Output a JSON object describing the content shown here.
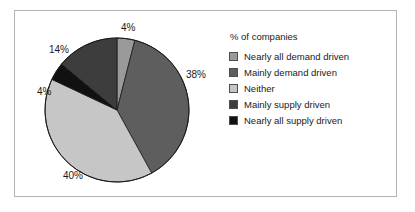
{
  "chart_data": {
    "type": "pie",
    "title": "",
    "legend_title": "% of companies",
    "legend_position": "right",
    "grid": false,
    "units": "percent",
    "categories": [
      "Nearly all demand driven",
      "Mainly demand driven",
      "Neither",
      "Mainly supply driven",
      "Nearly all supply driven"
    ],
    "values": [
      4,
      38,
      40,
      14,
      4
    ],
    "value_labels": [
      "4%",
      "38%",
      "40%",
      "14%",
      "4%"
    ],
    "colors": [
      "#9a9a9a",
      "#5e5e5e",
      "#c6c6c6",
      "#3d3d3d",
      "#111111"
    ],
    "draw_order": [
      "Nearly all demand driven",
      "Mainly demand driven",
      "Neither",
      "Nearly all supply driven",
      "Mainly supply driven"
    ],
    "slices": [
      {
        "label": "Nearly all demand driven",
        "value": 4,
        "value_label": "4%",
        "color": "#9a9a9a",
        "start_angle": 0,
        "end_angle": 14.4,
        "label_x": 107,
        "label_y": 12
      },
      {
        "label": "Mainly demand driven",
        "value": 38,
        "value_label": "38%",
        "color": "#5e5e5e",
        "start_angle": 14.4,
        "end_angle": 151.2,
        "label_x": 172,
        "label_y": 59
      },
      {
        "label": "Neither",
        "value": 40,
        "value_label": "40%",
        "color": "#c6c6c6",
        "start_angle": 151.2,
        "end_angle": 295.2,
        "label_x": 49,
        "label_y": 160
      },
      {
        "label": "Nearly all supply driven",
        "value": 4,
        "value_label": "4%",
        "color": "#111111",
        "start_angle": 295.2,
        "end_angle": 309.6,
        "label_x": 23,
        "label_y": 76
      },
      {
        "label": "Mainly supply driven",
        "value": 14,
        "value_label": "14%",
        "color": "#3d3d3d",
        "start_angle": 309.6,
        "end_angle": 360,
        "label_x": 35,
        "label_y": 34
      }
    ]
  },
  "frame": {
    "border_color": "#b4b4b4",
    "background": "#ffffff"
  }
}
